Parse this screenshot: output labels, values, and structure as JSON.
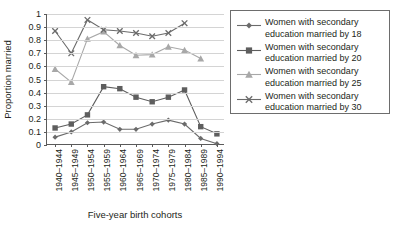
{
  "chart_data": {
    "type": "line",
    "title": "",
    "xlabel": "Five-year birth cohorts",
    "ylabel": "Proportion married",
    "ylim": [
      0,
      1
    ],
    "yticks": [
      "0",
      "0.1",
      "0.2",
      "0.3",
      "0.4",
      "0.5",
      "0.6",
      "0.7",
      "0.8",
      "0.9",
      "1"
    ],
    "grid": true,
    "legend_position": "right",
    "categories": [
      "1940–1944",
      "1945–1949",
      "1950–1954",
      "1955–1959",
      "1960–1964",
      "1965–1969",
      "1970–1974",
      "1975–1979",
      "1980–1984",
      "1985–1989",
      "1990–1994"
    ],
    "series": [
      {
        "name": "Women with secondary education married by 18",
        "marker": "diamond",
        "color": "#6b6b6b",
        "values": [
          0.06,
          0.1,
          0.17,
          0.175,
          0.12,
          0.12,
          0.16,
          0.19,
          0.16,
          0.05,
          0.01
        ]
      },
      {
        "name": "Women with secondary education married by 20",
        "marker": "square",
        "color": "#5e5e5e",
        "values": [
          0.13,
          0.16,
          0.23,
          0.445,
          0.43,
          0.365,
          0.33,
          0.365,
          0.42,
          0.14,
          0.085
        ]
      },
      {
        "name": "Women with secondary education married by 25",
        "marker": "triangle",
        "color": "#a8a8a8",
        "values": [
          0.58,
          0.48,
          0.81,
          0.865,
          0.76,
          0.685,
          0.69,
          0.75,
          0.725,
          0.66,
          null
        ]
      },
      {
        "name": "Women with secondary education married by 30",
        "marker": "cross",
        "color": "#6b6b6b",
        "values": [
          0.87,
          0.7,
          0.955,
          0.88,
          0.87,
          0.855,
          0.83,
          0.855,
          0.93,
          null,
          null
        ]
      }
    ]
  },
  "legend": {
    "entries": [
      "Women with secondary education married by 18",
      "Women with secondary education married by 20",
      "Women with secondary education married by 25",
      "Women with secondary education married by 30"
    ]
  }
}
